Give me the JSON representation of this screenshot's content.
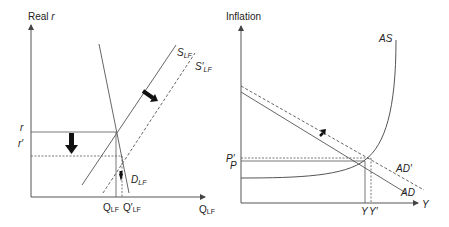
{
  "left_panel": {
    "y_axis_label": "Real ",
    "y_axis_label_italic": "r",
    "x_axis_label": "Q",
    "x_axis_label_sub": "LF",
    "r_label": "r",
    "r_prime_label": "r′",
    "q_label": "Q",
    "q_label_sub": "LF",
    "q_prime_label": "Q′",
    "q_prime_label_sub": "LF",
    "supply_label": "S",
    "supply_label_sub": "LF",
    "supply_prime_label": "S′",
    "supply_prime_label_sub": "LF",
    "demand_label": "D",
    "demand_label_sub": "LF"
  },
  "right_panel": {
    "y_axis_label": "Inflation",
    "x_axis_label": "Y",
    "as_label": "AS",
    "ad_label": "AD",
    "ad_prime_label": "AD′",
    "p_label": "P",
    "p_prime_label": "P′",
    "y_label": "Y",
    "y_prime_label": "Y′"
  },
  "colors": {
    "line": "#555555",
    "arrow": "#111111",
    "text": "#222222"
  }
}
